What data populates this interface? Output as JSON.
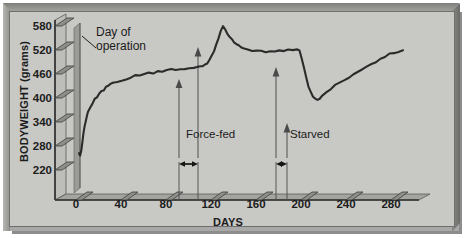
{
  "figure": {
    "background": "#c8c8c4",
    "frame_color": "#a9a9a9",
    "ink": "#1c1c1c"
  },
  "chart_data": {
    "type": "line",
    "title": "",
    "xlabel": "DAYS",
    "ylabel": "BODYWEIGHT (grams)",
    "xlim": [
      -8,
      295
    ],
    "ylim": [
      190,
      600
    ],
    "xticks": [
      0,
      40,
      80,
      120,
      160,
      200,
      240,
      280
    ],
    "yticks": [
      220,
      280,
      340,
      400,
      460,
      520,
      580
    ],
    "grid": false,
    "legend": null,
    "line_color": "#2b2b2b",
    "series": [
      {
        "name": "Bodyweight",
        "x": [
          0,
          1,
          2,
          3,
          4,
          5,
          6,
          7,
          8,
          10,
          12,
          14,
          16,
          18,
          20,
          22,
          24,
          26,
          28,
          30,
          34,
          38,
          42,
          46,
          50,
          54,
          58,
          62,
          66,
          70,
          74,
          78,
          82,
          86,
          90,
          94,
          98,
          102,
          105,
          108,
          110,
          112,
          114,
          116,
          118,
          120,
          122,
          124,
          126,
          128,
          130,
          132,
          134,
          136,
          138,
          140,
          142,
          144,
          146,
          150,
          154,
          158,
          162,
          166,
          170,
          174,
          178,
          182,
          186,
          190,
          194,
          196,
          198,
          200,
          202,
          204,
          206,
          208,
          210,
          212,
          214,
          216,
          220,
          224,
          228,
          232,
          236,
          240,
          244,
          248,
          252,
          256,
          260,
          264,
          268,
          272,
          276,
          280,
          284,
          288
        ],
        "y": [
          262,
          256,
          268,
          290,
          312,
          330,
          344,
          356,
          366,
          378,
          388,
          396,
          404,
          410,
          416,
          421,
          426,
          430,
          433,
          436,
          441,
          445,
          448,
          452,
          455,
          457,
          460,
          462,
          463,
          465,
          467,
          468,
          470,
          471,
          473,
          474,
          476,
          477,
          479,
          477,
          479,
          482,
          487,
          495,
          505,
          518,
          533,
          551,
          568,
          578,
          571,
          560,
          552,
          546,
          540,
          535,
          531,
          528,
          525,
          521,
          518,
          517,
          516,
          515,
          517,
          516,
          518,
          517,
          519,
          521,
          520,
          517,
          500,
          476,
          452,
          430,
          414,
          403,
          398,
          396,
          399,
          404,
          413,
          423,
          431,
          438,
          446,
          452,
          459,
          465,
          472,
          478,
          484,
          491,
          497,
          503,
          509,
          514,
          516,
          519
        ]
      }
    ],
    "annotations": [
      {
        "name": "day-of-operation",
        "label": "Day of\noperation",
        "x": 2,
        "type": "vertical-band"
      },
      {
        "name": "force-fed",
        "label": "Force-fed",
        "x_start": 110,
        "x_end": 127,
        "type": "span-arrow"
      },
      {
        "name": "starved",
        "label": "Starved",
        "x_start": 196,
        "x_end": 206,
        "type": "span-arrow"
      }
    ]
  },
  "labels": {
    "y_axis_title": "BODYWEIGHT (grams)",
    "x_axis_title": "DAYS",
    "y_ticks": [
      "580",
      "520",
      "460",
      "400",
      "340",
      "280",
      "220"
    ],
    "x_ticks": [
      "0",
      "40",
      "80",
      "120",
      "160",
      "200",
      "240",
      "280"
    ],
    "day_of_operation_line1": "Day of",
    "day_of_operation_line2": "operation",
    "force_fed": "Force-fed",
    "starved": "Starved"
  }
}
